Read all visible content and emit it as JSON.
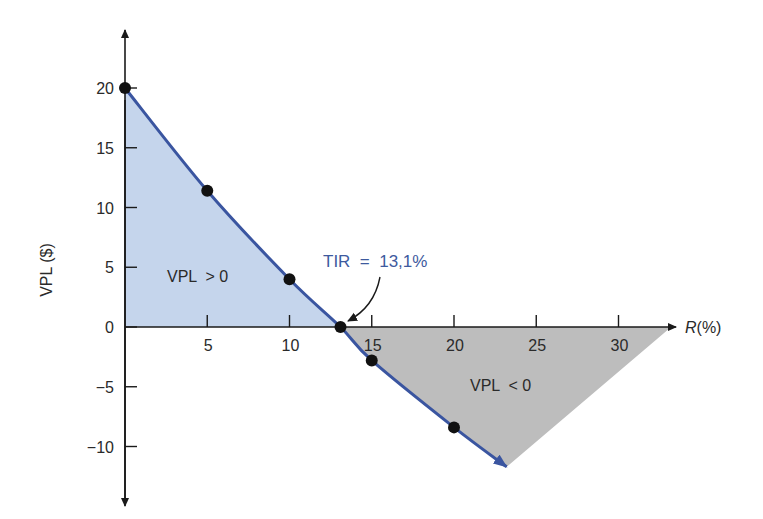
{
  "chart_data": {
    "type": "line",
    "title": "",
    "xlabel": "R(%)",
    "ylabel": "VPL ($)",
    "xlim": [
      0,
      34
    ],
    "ylim": [
      -15,
      24
    ],
    "grid": false,
    "x_ticks": [
      5,
      10,
      15,
      20,
      25,
      30
    ],
    "x_tick_labels": [
      "5",
      "10",
      "15",
      "20",
      "25",
      "30"
    ],
    "y_ticks": [
      20,
      15,
      10,
      5,
      0,
      -5,
      -10
    ],
    "y_tick_labels": [
      "20",
      "15",
      "10",
      "5",
      "0",
      "−5",
      "−10"
    ],
    "series": [
      {
        "name": "VPL",
        "x": [
          0,
          5,
          10,
          13.1,
          15,
          20
        ],
        "y": [
          20,
          11.4,
          4.0,
          0,
          -2.8,
          -8.4
        ],
        "color": "#3a55a0",
        "markers": true
      }
    ],
    "curve_end": {
      "x": 23.2,
      "y": -11.7
    },
    "regions": [
      {
        "label": "VPL  > 0",
        "color": "#c5d5ec"
      },
      {
        "label": "VPL  < 0",
        "color": "#bdbdbd"
      }
    ],
    "annotations": [
      {
        "text": "TIR  =  13,1%",
        "x": 13.1,
        "y": 0,
        "color": "#3e5a9e"
      }
    ]
  },
  "labels": {
    "ylabel": "VPL ($)",
    "xlabel_italic": "R",
    "xlabel_rest": "(%)",
    "region_positive": "VPL  > 0",
    "region_negative": "VPL  < 0",
    "tir": "TIR  =  13,1%"
  }
}
